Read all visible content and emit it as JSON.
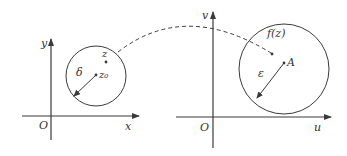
{
  "colors": {
    "line": "#3a3a3a",
    "text": "#333333",
    "background": "#ffffff"
  },
  "left_plane": {
    "origin_label": "O",
    "x_axis_label": "x",
    "y_axis_label": "y",
    "circle": {
      "center_label": "z₀",
      "radius_label": "δ"
    },
    "point_label": "z"
  },
  "right_plane": {
    "origin_label": "O",
    "x_axis_label": "u",
    "y_axis_label": "v",
    "circle": {
      "center_label": "A",
      "radius_label": "ε"
    },
    "point_label": "f(z)"
  },
  "mapping": {
    "style": "dashed-arc",
    "from": "z",
    "to": "f(z)"
  }
}
